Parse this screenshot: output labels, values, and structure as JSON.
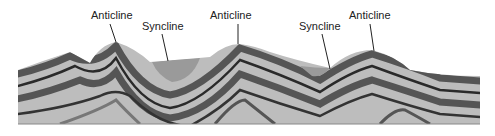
{
  "diagram": {
    "labels": [
      {
        "id": "anticline-1",
        "text": "Anticline",
        "x": 91,
        "y": 10
      },
      {
        "id": "syncline-1",
        "text": "Syncline",
        "x": 142,
        "y": 21
      },
      {
        "id": "anticline-2",
        "text": "Anticline",
        "x": 210,
        "y": 10
      },
      {
        "id": "syncline-2",
        "text": "Syncline",
        "x": 299,
        "y": 21
      },
      {
        "id": "anticline-3",
        "text": "Anticline",
        "x": 349,
        "y": 10
      }
    ],
    "colors": {
      "light_layer": "#bdbdbd",
      "mid_layer": "#8a8a8a",
      "dark_layer": "#555555",
      "darkest_line": "#2a2a2a",
      "syncline_fill": "#9a9a9a"
    }
  }
}
